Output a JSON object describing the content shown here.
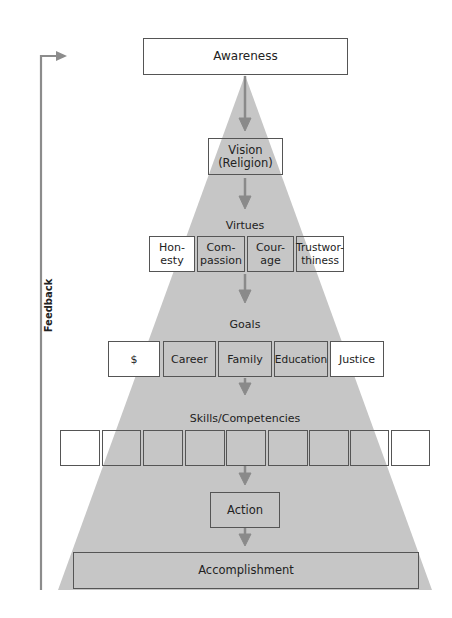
{
  "diagram": {
    "feedback": {
      "label": "Feedback"
    },
    "levels": {
      "awareness": "Awareness",
      "vision": {
        "line1": "Vision",
        "line2": "(Religion)"
      },
      "virtues": {
        "title": "Virtues",
        "items": [
          {
            "line1": "Hon-",
            "line2": "esty"
          },
          {
            "line1": "Com-",
            "line2": "passion"
          },
          {
            "line1": "Cour-",
            "line2": "age"
          },
          {
            "line1": "Trustwor-",
            "line2": "thiness"
          }
        ]
      },
      "goals": {
        "title": "Goals",
        "items": [
          "$",
          "Career",
          "Family",
          "Education",
          "Justice"
        ]
      },
      "skills": {
        "title": "Skills/Competencies",
        "box_count": 9
      },
      "action": "Action",
      "accomplishment": "Accomplishment"
    },
    "colors": {
      "pyramid": "#c4c4c4",
      "arrow": "#8a8a8a",
      "border": "#555555"
    }
  }
}
